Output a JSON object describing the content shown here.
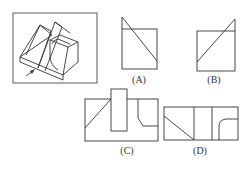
{
  "figure": {
    "stroke_color": "#333333"
  },
  "options": [
    {
      "label": "(A)"
    },
    {
      "label": "(B)"
    },
    {
      "label": "(C)"
    },
    {
      "label": "(D)"
    }
  ]
}
